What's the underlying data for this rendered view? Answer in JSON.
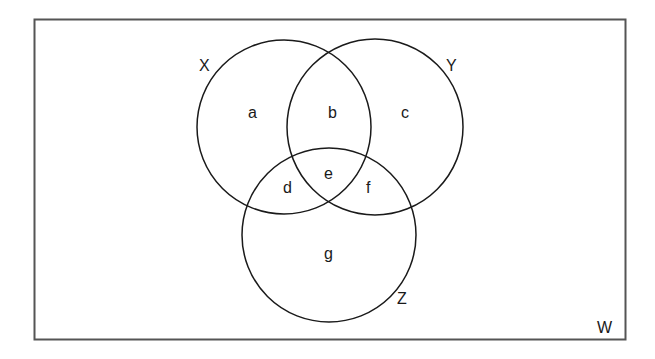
{
  "diagram": {
    "type": "venn",
    "universe": {
      "label": "W"
    },
    "sets": [
      {
        "name": "X",
        "label": "X"
      },
      {
        "name": "Y",
        "label": "Y"
      },
      {
        "name": "Z",
        "label": "Z"
      }
    ],
    "regions": [
      {
        "id": "a",
        "label": "a",
        "membership": "X only"
      },
      {
        "id": "b",
        "label": "b",
        "membership": "X and Y only"
      },
      {
        "id": "c",
        "label": "c",
        "membership": "Y only"
      },
      {
        "id": "d",
        "label": "d",
        "membership": "X and Z only"
      },
      {
        "id": "e",
        "label": "e",
        "membership": "X, Y and Z"
      },
      {
        "id": "f",
        "label": "f",
        "membership": "Y and Z only"
      },
      {
        "id": "g",
        "label": "g",
        "membership": "Z only"
      }
    ],
    "colors": {
      "stroke": "#1a1a1a",
      "frame": "#555555",
      "background": "#ffffff"
    }
  }
}
